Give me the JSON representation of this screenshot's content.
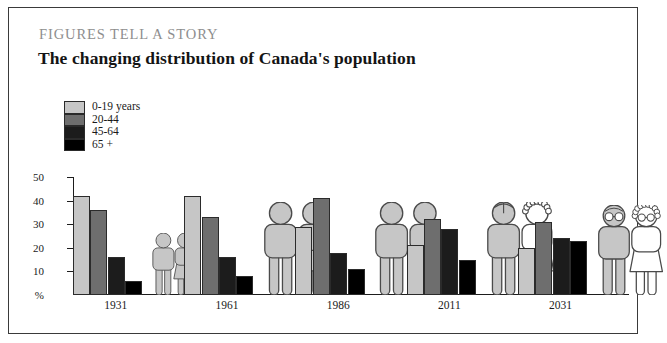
{
  "header": {
    "kicker": "FIGURES TELL A STORY",
    "headline": "The changing distribution of Canada's population"
  },
  "legend": {
    "items": [
      {
        "label": "0-19 years",
        "color": "#c6c6c6"
      },
      {
        "label": "20-44",
        "color": "#6e6e6e"
      },
      {
        "label": "45-64",
        "color": "#1c1c1c"
      },
      {
        "label": "65 +",
        "color": "#000000"
      }
    ]
  },
  "axis": {
    "y_unit": "%",
    "y_ticks": [
      "50",
      "40",
      "30",
      "20",
      "10"
    ]
  },
  "chart_data": {
    "type": "bar",
    "title": "The changing distribution of Canada's population",
    "subtitle": "FIGURES TELL A STORY",
    "xlabel": "",
    "ylabel": "%",
    "ylim": [
      0,
      50
    ],
    "grid": false,
    "legend_position": "top-left",
    "categories": [
      "1931",
      "1961",
      "1986",
      "2011",
      "2031"
    ],
    "series": [
      {
        "name": "0-19 years",
        "color": "#c6c6c6",
        "values": [
          42,
          42,
          29,
          21,
          20
        ]
      },
      {
        "name": "20-44",
        "color": "#6e6e6e",
        "values": [
          36,
          33,
          41,
          32,
          31
        ]
      },
      {
        "name": "45-64",
        "color": "#1c1c1c",
        "values": [
          16,
          16,
          18,
          28,
          24
        ]
      },
      {
        "name": "65 +",
        "color": "#000000",
        "values": [
          6,
          8,
          11,
          15,
          23
        ]
      }
    ],
    "annotations": [
      {
        "category": "1931",
        "icon": "couple-small-gray",
        "description": "small adult couple pictogram"
      },
      {
        "category": "1961",
        "icon": "couple-large-gray",
        "description": "large adult couple pictogram"
      },
      {
        "category": "1986",
        "icon": "couple-large-gray",
        "description": "large adult couple pictogram"
      },
      {
        "category": "2011",
        "icon": "couple-aging",
        "description": "balding man and curly-haired woman pictogram"
      },
      {
        "category": "2031",
        "icon": "couple-elderly-glasses",
        "description": "elderly couple with glasses pictogram"
      }
    ]
  }
}
